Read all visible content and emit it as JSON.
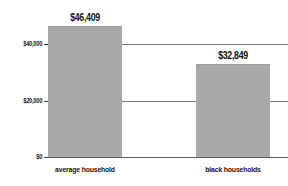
{
  "chart_data": {
    "type": "bar",
    "title": "",
    "subtitle": "",
    "xlabel": "",
    "ylabel": "",
    "categories": [
      "average household",
      "black households"
    ],
    "values": [
      46409,
      32849
    ],
    "value_labels": [
      "$46,409",
      "$32,849"
    ],
    "ytick_labels": [
      "$40,000",
      "$20,000",
      "$0"
    ],
    "ytick_values": [
      40000,
      20000,
      0
    ],
    "ylim": [
      0,
      46409
    ],
    "grid": true,
    "grid_axis": "y",
    "legend": false,
    "legend_position": "none",
    "orientation": "vertical",
    "bar_color": "#a9a9a9",
    "gridline_color": "#767676",
    "axis_color": "#5c5c5c",
    "text_color": "#121212",
    "background_color": "#ffffff"
  }
}
